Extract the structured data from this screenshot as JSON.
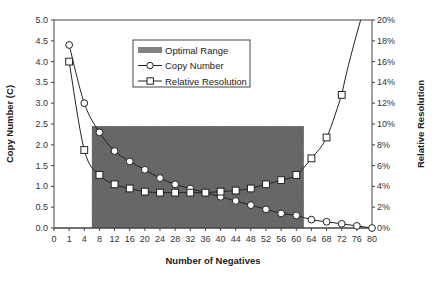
{
  "chart_data": {
    "type": "line",
    "title": "",
    "xlabel": "Number of Negatives",
    "ylabel": "Copy Number (C)",
    "y2label": "Relative Resolution",
    "categories": [
      "0",
      "1",
      "4",
      "8",
      "12",
      "16",
      "20",
      "24",
      "28",
      "32",
      "36",
      "40",
      "44",
      "48",
      "52",
      "56",
      "60",
      "64",
      "68",
      "72",
      "76",
      "80"
    ],
    "ylim": [
      0,
      5.0
    ],
    "y_ticks": [
      "0.0",
      "0.5",
      "1.0",
      "1.5",
      "2.0",
      "2.5",
      "3.0",
      "3.5",
      "4.0",
      "4.5",
      "5.0"
    ],
    "y2lim": [
      0,
      20
    ],
    "y2_ticks": [
      "0%",
      "2%",
      "4%",
      "6%",
      "8%",
      "10%",
      "12%",
      "14%",
      "16%",
      "18%",
      "20%"
    ],
    "grid": false,
    "legend_position": "upper-center",
    "series": [
      {
        "name": "Copy Number",
        "axis": "left",
        "marker": "circle",
        "x": [
          1,
          4,
          8,
          12,
          16,
          20,
          24,
          28,
          32,
          36,
          40,
          44,
          48,
          52,
          56,
          60,
          64,
          68,
          72,
          76,
          80
        ],
        "values": [
          4.4,
          3.0,
          2.3,
          1.85,
          1.6,
          1.4,
          1.2,
          1.05,
          0.95,
          0.85,
          0.75,
          0.65,
          0.55,
          0.45,
          0.35,
          0.3,
          0.2,
          0.15,
          0.1,
          0.05,
          0.0
        ]
      },
      {
        "name": "Relative Resolution",
        "axis": "right",
        "marker": "square",
        "unit": "%",
        "x": [
          1,
          4,
          8,
          12,
          16,
          20,
          24,
          28,
          32,
          36,
          40,
          44,
          48,
          52,
          56,
          60,
          64,
          68,
          72
        ],
        "values": [
          16.0,
          7.5,
          5.1,
          4.2,
          3.8,
          3.5,
          3.4,
          3.4,
          3.4,
          3.4,
          3.5,
          3.6,
          3.8,
          4.2,
          4.6,
          5.1,
          6.7,
          8.7,
          12.8
        ]
      }
    ],
    "annotations": [
      {
        "name": "Optimal Range",
        "type": "shaded-region",
        "x_start": 6,
        "x_end": 62,
        "y_top": 2.45
      }
    ]
  },
  "legend": {
    "items": [
      {
        "label": "Optimal Range",
        "symbol": "shaded-swatch"
      },
      {
        "label": "Copy Number",
        "symbol": "line-circle"
      },
      {
        "label": "Relative Resolution",
        "symbol": "line-square"
      }
    ]
  },
  "colors": {
    "line": "#222222",
    "shade": "#6e6e6e",
    "marker_fill": "#ffffff"
  }
}
